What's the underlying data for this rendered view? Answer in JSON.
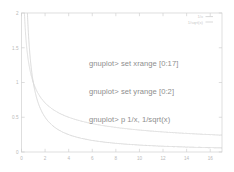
{
  "app": {
    "name": "gnuplot",
    "prompt": "gnuplot>"
  },
  "console": {
    "lines": [
      "gnuplot> set xrange [0:17]",
      "gnuplot> set yrange [0:2]",
      "gnuplot> p 1/x, 1/sqrt(x)"
    ],
    "line1": "gnuplot> set xrange [0:17]",
    "line2": "gnuplot> set yrange [0:2]",
    "line3": "gnuplot> p 1/x, 1/sqrt(x)"
  },
  "legend": {
    "entries": [
      {
        "label": "1/x",
        "color": "#c8c8c8"
      },
      {
        "label": "1/sqrt(x)",
        "color": "#c8c8c8"
      }
    ],
    "position": "top-right",
    "entry0_label": "1/x",
    "entry1_label": "1/sqrt(x)"
  },
  "colors": {
    "border": "#d0d0d0",
    "tick_text": "#b9b9b9",
    "curve_1_over_x": "#cfcfcf",
    "curve_1_over_sqrt_x": "#d4d4d4",
    "console_text": "#8e8e8e",
    "background": "#ffffff"
  },
  "chart_data": {
    "type": "line",
    "title": "",
    "xlabel": "",
    "ylabel": "",
    "xlim": [
      0,
      17
    ],
    "ylim": [
      0,
      2
    ],
    "xticks": [
      0,
      2,
      4,
      6,
      8,
      10,
      12,
      14,
      16
    ],
    "xtick_labels": [
      "0",
      "2",
      "4",
      "6",
      "8",
      "10",
      "12",
      "14",
      "16"
    ],
    "yticks": [
      0,
      0.5,
      1,
      1.5,
      2
    ],
    "ytick_labels": [
      "0",
      "0.5",
      "1",
      "1.5",
      "2"
    ],
    "grid": false,
    "legend_position": "top-right",
    "series": [
      {
        "name": "1/x",
        "formula": "1/x",
        "color": "#cfcfcf",
        "x": [
          0.5,
          0.6,
          0.7,
          0.8,
          0.9,
          1,
          1.25,
          1.5,
          1.75,
          2,
          2.5,
          3,
          3.5,
          4,
          5,
          6,
          7,
          8,
          9,
          10,
          11,
          12,
          13,
          14,
          15,
          16,
          17
        ],
        "y": [
          2,
          1.667,
          1.429,
          1.25,
          1.111,
          1,
          0.8,
          0.667,
          0.571,
          0.5,
          0.4,
          0.333,
          0.286,
          0.25,
          0.2,
          0.167,
          0.143,
          0.125,
          0.111,
          0.1,
          0.091,
          0.083,
          0.077,
          0.071,
          0.067,
          0.063,
          0.059
        ]
      },
      {
        "name": "1/sqrt(x)",
        "formula": "1/sqrt(x)",
        "color": "#d4d4d4",
        "x": [
          0.25,
          0.3,
          0.4,
          0.5,
          0.6,
          0.8,
          1,
          1.25,
          1.5,
          2,
          2.5,
          3,
          3.5,
          4,
          5,
          6,
          7,
          8,
          9,
          10,
          11,
          12,
          13,
          14,
          15,
          16,
          17
        ],
        "y": [
          2,
          1.826,
          1.581,
          1.414,
          1.291,
          1.118,
          1,
          0.894,
          0.816,
          0.707,
          0.632,
          0.577,
          0.535,
          0.5,
          0.447,
          0.408,
          0.378,
          0.354,
          0.333,
          0.316,
          0.302,
          0.289,
          0.277,
          0.267,
          0.258,
          0.25,
          0.243
        ]
      }
    ]
  }
}
